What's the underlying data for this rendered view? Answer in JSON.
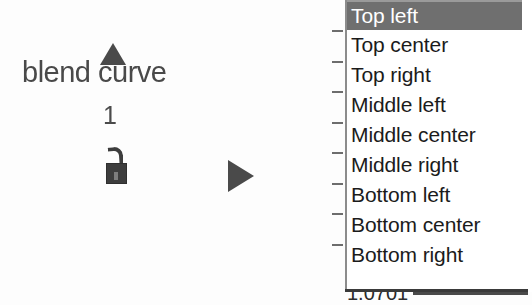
{
  "canvas": {
    "width": 532,
    "height": 305,
    "background": "#ffffff"
  },
  "left_panel": {
    "label": "blend curve",
    "value": "1",
    "icons": {
      "up_triangle": "up-triangle-icon",
      "lock": "open-padlock-icon",
      "play": "play-triangle-icon"
    }
  },
  "dropdown": {
    "selected_index": 0,
    "highlight_color": "#6f6f6f",
    "highlight_text_color": "#ffffff",
    "items": [
      {
        "label": "Top left"
      },
      {
        "label": "Top center"
      },
      {
        "label": "Top right"
      },
      {
        "label": "Middle left"
      },
      {
        "label": "Middle center"
      },
      {
        "label": "Middle right"
      },
      {
        "label": "Bottom left"
      },
      {
        "label": "Bottom center"
      },
      {
        "label": "Bottom right"
      }
    ]
  },
  "scale_rail": {
    "tick_count": 8,
    "tick_color": "#6d6d6d"
  },
  "clipped_field": {
    "value": "1.0701"
  }
}
